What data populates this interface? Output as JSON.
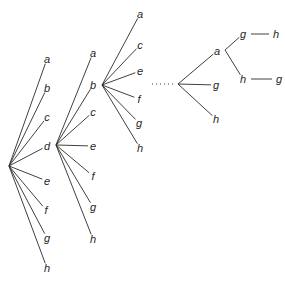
{
  "diagram": {
    "type": "tree",
    "level1": {
      "root": [
        9,
        166
      ],
      "nodes": [
        {
          "label": "a",
          "x": 47,
          "y": 59
        },
        {
          "label": "b",
          "x": 47,
          "y": 88
        },
        {
          "label": "c",
          "x": 47,
          "y": 117
        },
        {
          "label": "d",
          "x": 47,
          "y": 146
        },
        {
          "label": "e",
          "x": 47,
          "y": 181
        },
        {
          "label": "f",
          "x": 46,
          "y": 210
        },
        {
          "label": "g",
          "x": 47,
          "y": 238
        },
        {
          "label": "h",
          "x": 47,
          "y": 268
        }
      ]
    },
    "level2": {
      "parent": "d",
      "root": [
        56,
        145
      ],
      "nodes": [
        {
          "label": "a",
          "x": 93,
          "y": 53
        },
        {
          "label": "b",
          "x": 93,
          "y": 85
        },
        {
          "label": "c",
          "x": 93,
          "y": 112
        },
        {
          "label": "e",
          "x": 93,
          "y": 146
        },
        {
          "label": "f",
          "x": 93,
          "y": 176
        },
        {
          "label": "g",
          "x": 93,
          "y": 207
        },
        {
          "label": "h",
          "x": 93,
          "y": 239
        }
      ]
    },
    "level3": {
      "parent": "b",
      "root": [
        102,
        85
      ],
      "nodes": [
        {
          "label": "a",
          "x": 140,
          "y": 14
        },
        {
          "label": "c",
          "x": 140,
          "y": 45
        },
        {
          "label": "e",
          "x": 140,
          "y": 71
        },
        {
          "label": "f",
          "x": 139,
          "y": 99
        },
        {
          "label": "g",
          "x": 139,
          "y": 123
        },
        {
          "label": "h",
          "x": 140,
          "y": 148
        }
      ]
    },
    "ellipsis": "····",
    "final": {
      "root": [
        178,
        84
      ],
      "nodes": [
        {
          "label": "a",
          "x": 217,
          "y": 51
        },
        {
          "label": "g",
          "x": 216,
          "y": 85
        },
        {
          "label": "h",
          "x": 216,
          "y": 119
        }
      ],
      "sub_of_a": {
        "root": [
          225,
          50
        ],
        "nodes": [
          {
            "label": "g",
            "x": 243,
            "y": 34,
            "next": {
              "label": "h",
              "x": 276,
              "y": 34
            }
          },
          {
            "label": "h",
            "x": 243,
            "y": 79,
            "next": {
              "label": "g",
              "x": 279,
              "y": 79
            }
          }
        ]
      }
    }
  }
}
